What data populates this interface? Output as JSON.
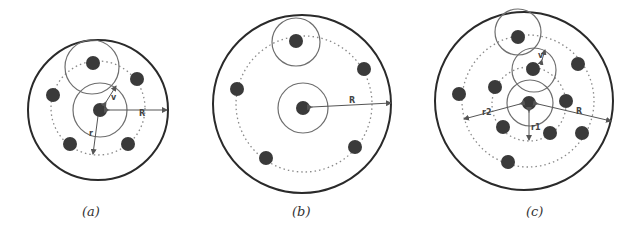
{
  "colors": {
    "outer": "#2a2a2a",
    "solid_ring": "#6e6e6e",
    "dotted": "#8a8a8a",
    "node": "#3a3a3a",
    "arrow": "#555555"
  },
  "panels": [
    {
      "id": "a",
      "caption": "(a)",
      "labels": {
        "R": "R",
        "r": "r",
        "v": "v"
      }
    },
    {
      "id": "b",
      "caption": "(b)",
      "labels": {
        "R": "R"
      }
    },
    {
      "id": "c",
      "caption": "(c)",
      "labels": {
        "R": "R",
        "r1": "r1",
        "r2": "r2",
        "v": "v"
      }
    }
  ]
}
